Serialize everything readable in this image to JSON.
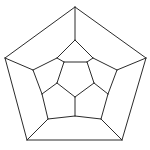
{
  "figure": {
    "subtitle": "Schlegel diagram of the regular dodecahedron",
    "background_color": "#ffffff",
    "line_color": "#2b2b2b",
    "line_width": 1,
    "canvas": {
      "width": 150,
      "height": 150
    },
    "vertex_count": 20,
    "edge_count": 30,
    "face_count": 12
  },
  "graph_data": {
    "type": "planar-graph",
    "layout": "concentric-pentagonal-rings",
    "rings": [
      {
        "name": "outer-pentagon",
        "vertex_ids": [
          "o0",
          "o1",
          "o2",
          "o3",
          "o4"
        ],
        "orientation": "point-up"
      },
      {
        "name": "ring-2",
        "vertex_ids": [
          "a0",
          "a1",
          "a2",
          "a3",
          "a4"
        ],
        "orientation": "point-up"
      },
      {
        "name": "ring-3",
        "vertex_ids": [
          "b0",
          "b1",
          "b2",
          "b3",
          "b4"
        ],
        "orientation": "point-down"
      },
      {
        "name": "inner-pentagon",
        "vertex_ids": [
          "c0",
          "c1",
          "c2",
          "c3",
          "c4"
        ],
        "orientation": "point-down"
      }
    ],
    "vertices": {
      "o0": [
        75,
        7
      ],
      "o1": [
        146,
        58
      ],
      "o2": [
        122,
        140
      ],
      "o3": [
        27,
        140
      ],
      "o4": [
        5,
        58
      ],
      "a0": [
        75,
        40
      ],
      "a1": [
        117,
        70
      ],
      "a2": [
        101,
        119
      ],
      "a3": [
        48,
        119
      ],
      "a4": [
        33,
        70
      ],
      "b0": [
        57,
        58
      ],
      "b1": [
        93,
        58
      ],
      "b2": [
        108,
        94
      ],
      "b3": [
        75,
        116
      ],
      "b4": [
        42,
        94
      ],
      "c0": [
        64,
        62
      ],
      "c1": [
        87,
        62
      ],
      "c2": [
        94,
        83
      ],
      "c3": [
        75,
        97
      ],
      "c4": [
        57,
        83
      ]
    },
    "edges": [
      [
        "o0",
        "o1"
      ],
      [
        "o1",
        "o2"
      ],
      [
        "o2",
        "o3"
      ],
      [
        "o3",
        "o4"
      ],
      [
        "o4",
        "o0"
      ],
      [
        "o0",
        "a0"
      ],
      [
        "o1",
        "a1"
      ],
      [
        "o2",
        "a2"
      ],
      [
        "o3",
        "a3"
      ],
      [
        "o4",
        "a4"
      ],
      [
        "a0",
        "b0"
      ],
      [
        "a0",
        "b1"
      ],
      [
        "a1",
        "b1"
      ],
      [
        "a1",
        "b2"
      ],
      [
        "a2",
        "b2"
      ],
      [
        "a2",
        "b3"
      ],
      [
        "a3",
        "b3"
      ],
      [
        "a3",
        "b4"
      ],
      [
        "a4",
        "b4"
      ],
      [
        "a4",
        "b0"
      ],
      [
        "b0",
        "c0"
      ],
      [
        "b1",
        "c1"
      ],
      [
        "b2",
        "c2"
      ],
      [
        "b3",
        "c3"
      ],
      [
        "b4",
        "c4"
      ],
      [
        "c0",
        "c1"
      ],
      [
        "c1",
        "c2"
      ],
      [
        "c2",
        "c3"
      ],
      [
        "c3",
        "c4"
      ],
      [
        "c4",
        "c0"
      ]
    ],
    "faces": [
      {
        "name": "inner-pentagon-face",
        "vertex_ids": [
          "c0",
          "c1",
          "c2",
          "c3",
          "c4"
        ]
      },
      {
        "name": "outer-ring-face-top-left",
        "vertex_ids": [
          "o0",
          "a0",
          "b0",
          "a4",
          "o4"
        ]
      },
      {
        "name": "outer-ring-face-top-right",
        "vertex_ids": [
          "o0",
          "a0",
          "b1",
          "a1",
          "o1"
        ]
      },
      {
        "name": "outer-ring-face-right",
        "vertex_ids": [
          "o1",
          "a1",
          "b2",
          "a2",
          "o2"
        ]
      },
      {
        "name": "outer-ring-face-bottom",
        "vertex_ids": [
          "o2",
          "a2",
          "b3",
          "a3",
          "o3"
        ]
      },
      {
        "name": "outer-ring-face-left",
        "vertex_ids": [
          "o3",
          "a3",
          "b4",
          "a4",
          "o4"
        ]
      },
      {
        "name": "inner-ring-face-top",
        "vertex_ids": [
          "a0",
          "b1",
          "c1",
          "c0",
          "b0"
        ]
      },
      {
        "name": "inner-ring-face-upper-right",
        "vertex_ids": [
          "a1",
          "b2",
          "c2",
          "c1",
          "b1"
        ]
      },
      {
        "name": "inner-ring-face-lower-right",
        "vertex_ids": [
          "a2",
          "b3",
          "c3",
          "c2",
          "b2"
        ]
      },
      {
        "name": "inner-ring-face-lower-left",
        "vertex_ids": [
          "a3",
          "b4",
          "c4",
          "c3",
          "b3"
        ]
      },
      {
        "name": "inner-ring-face-upper-left",
        "vertex_ids": [
          "a4",
          "b0",
          "c0",
          "c4",
          "b4"
        ]
      }
    ]
  }
}
